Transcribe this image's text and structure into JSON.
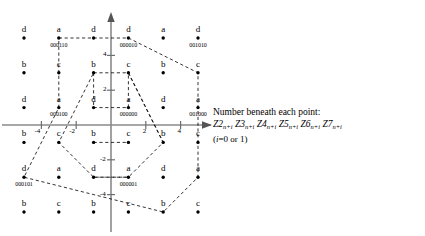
{
  "figure": {
    "axes": {
      "x_ticks": [
        "-4",
        "-2",
        "2",
        "4"
      ],
      "y_ticks": [
        "4",
        "2",
        "-2",
        "-4"
      ],
      "x_range": [
        -6,
        6
      ],
      "y_range": [
        -6,
        6
      ],
      "origin_px": {
        "x": 111,
        "y": 125
      },
      "unit_px": 17.4,
      "axis_color": "#808080",
      "dot_color": "#000000",
      "dashed_color": "#000000"
    },
    "points": [
      {
        "label": "d",
        "code": "",
        "x": -5,
        "y": 5
      },
      {
        "label": "a",
        "code": "000110",
        "x": -3,
        "y": 5
      },
      {
        "label": "d",
        "code": "",
        "x": -1,
        "y": 5
      },
      {
        "label": "d",
        "code": "000010",
        "x": 1,
        "y": 5
      },
      {
        "label": "a",
        "code": "",
        "x": 3,
        "y": 5
      },
      {
        "label": "d",
        "code": "001010",
        "x": 5,
        "y": 5
      },
      {
        "label": "b",
        "code": "",
        "x": -5,
        "y": 3
      },
      {
        "label": "c",
        "code": "",
        "x": -3,
        "y": 3
      },
      {
        "label": "b",
        "code": "",
        "x": -1,
        "y": 3
      },
      {
        "label": "c",
        "code": "",
        "x": 1,
        "y": 3
      },
      {
        "label": "b",
        "code": "",
        "x": 3,
        "y": 3
      },
      {
        "label": "c",
        "code": "",
        "x": 5,
        "y": 3
      },
      {
        "label": "d",
        "code": "",
        "x": -5,
        "y": 1
      },
      {
        "label": "a",
        "code": "000100",
        "x": -3,
        "y": 1
      },
      {
        "label": "d",
        "code": "",
        "x": -1,
        "y": 1
      },
      {
        "label": "a",
        "code": "000000",
        "x": 1,
        "y": 1
      },
      {
        "label": "d",
        "code": "",
        "x": 3,
        "y": 1
      },
      {
        "label": "a",
        "code": "001000",
        "x": 5,
        "y": 1
      },
      {
        "label": "b",
        "code": "",
        "x": -5,
        "y": -1
      },
      {
        "label": "c",
        "code": "",
        "x": -3,
        "y": -1
      },
      {
        "label": "b",
        "code": "",
        "x": -1,
        "y": -1
      },
      {
        "label": "c",
        "code": "",
        "x": 1,
        "y": -1
      },
      {
        "label": "b",
        "code": "",
        "x": 3,
        "y": -1
      },
      {
        "label": "c",
        "code": "",
        "x": 5,
        "y": -1
      },
      {
        "label": "d",
        "code": "000101",
        "x": -5,
        "y": -3
      },
      {
        "label": "a",
        "code": "",
        "x": -3,
        "y": -3
      },
      {
        "label": "d",
        "code": "",
        "x": -1,
        "y": -3
      },
      {
        "label": "a",
        "code": "000001",
        "x": 1,
        "y": -3
      },
      {
        "label": "d",
        "code": "",
        "x": 3,
        "y": -3
      },
      {
        "label": "a",
        "code": "",
        "x": 5,
        "y": -3
      },
      {
        "label": "b",
        "code": "",
        "x": -5,
        "y": -5
      },
      {
        "label": "c",
        "code": "",
        "x": -3,
        "y": -5
      },
      {
        "label": "b",
        "code": "",
        "x": -1,
        "y": -5
      },
      {
        "label": "c",
        "code": "",
        "x": 1,
        "y": -5
      },
      {
        "label": "b",
        "code": "",
        "x": 3,
        "y": -5
      },
      {
        "label": "c",
        "code": "",
        "x": 5,
        "y": -5
      }
    ],
    "dashed_paths": [
      [
        [
          -3,
          5
        ],
        [
          1,
          5
        ],
        [
          5,
          3
        ],
        [
          5,
          -3
        ],
        [
          3,
          -5
        ],
        [
          -5,
          -3
        ],
        [
          -3,
          1
        ],
        [
          -3,
          5
        ]
      ],
      [
        [
          -1,
          3
        ],
        [
          1,
          3
        ],
        [
          3,
          -1
        ],
        [
          1,
          -3
        ],
        [
          -1,
          -3
        ],
        [
          -3,
          -1
        ],
        [
          -1,
          3
        ]
      ],
      [
        [
          -1,
          3
        ],
        [
          -1,
          1
        ],
        [
          1,
          1
        ],
        [
          1,
          3
        ]
      ],
      [
        [
          -1,
          -1
        ],
        [
          1,
          -1
        ]
      ],
      [
        [
          1,
          3
        ],
        [
          3,
          -1
        ]
      ],
      [
        [
          -1,
          -3
        ],
        [
          1,
          -3
        ]
      ]
    ]
  },
  "caption": {
    "line1": "Number beneath each point:",
    "formula_terms": [
      {
        "name": "Z2",
        "sub": "n+i"
      },
      {
        "name": "Z3",
        "sub": "n+i"
      },
      {
        "name": "Z4",
        "sub": "n+i"
      },
      {
        "name": "Z5",
        "sub": "n+i"
      },
      {
        "name": "Z6",
        "sub": "n+i"
      },
      {
        "name": "Z7",
        "sub": "n+i"
      }
    ],
    "note_prefix": "(",
    "note_var": "i",
    "note_rest": "=0 or 1)"
  }
}
